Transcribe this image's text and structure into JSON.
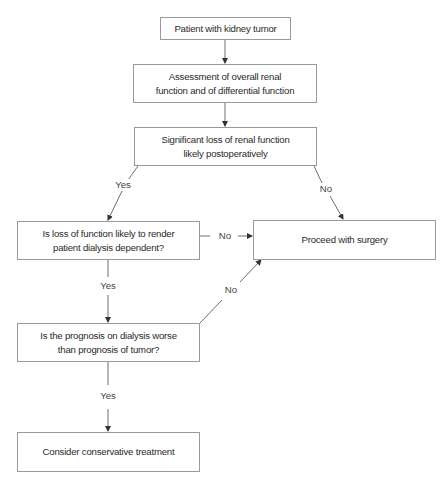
{
  "diagram": {
    "type": "flowchart",
    "nodes": [
      {
        "id": "n1",
        "text": "Patient with kidney tumor"
      },
      {
        "id": "n2",
        "text": "Assessment of overall renal function and of differential function"
      },
      {
        "id": "n3",
        "text": "Significant loss of renal function likely postoperatively"
      },
      {
        "id": "n4",
        "text": "Is loss of function likely to render patient dialysis dependent?"
      },
      {
        "id": "n5",
        "text": "Proceed with surgery"
      },
      {
        "id": "n6",
        "text": "Is the prognosis on dialysis worse than prognosis of tumor?"
      },
      {
        "id": "n7",
        "text": "Consider conservative treatment"
      }
    ],
    "edges": [
      {
        "from": "n1",
        "to": "n2",
        "label": ""
      },
      {
        "from": "n2",
        "to": "n3",
        "label": ""
      },
      {
        "from": "n3",
        "to": "n4",
        "label": "Yes"
      },
      {
        "from": "n3",
        "to": "n5",
        "label": "No"
      },
      {
        "from": "n4",
        "to": "n5",
        "label": "No"
      },
      {
        "from": "n4",
        "to": "n6",
        "label": "Yes"
      },
      {
        "from": "n6",
        "to": "n5",
        "label": "No"
      },
      {
        "from": "n6",
        "to": "n7",
        "label": "Yes"
      }
    ]
  },
  "colors": {
    "line": "#6e6e6e",
    "border": "#9a9a9a",
    "text": "#2a2a2a"
  }
}
